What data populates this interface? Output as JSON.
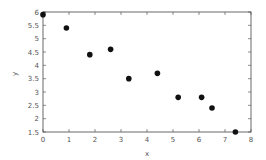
{
  "chart_data": {
    "type": "scatter",
    "title": "",
    "xlabel": "x",
    "ylabel": "y",
    "xlim": [
      0,
      8
    ],
    "ylim": [
      1.5,
      6
    ],
    "x_ticks": [
      "0",
      "1",
      "2",
      "3",
      "4",
      "5",
      "6",
      "7",
      "8"
    ],
    "y_ticks": [
      "1.5",
      "2",
      "2.5",
      "3",
      "3.5",
      "4",
      "4.5",
      "5",
      "5.5",
      "6"
    ],
    "grid": false,
    "legend": null,
    "series": [
      {
        "name": "data",
        "color": "#111111",
        "points": [
          {
            "x": 0.0,
            "y": 5.9
          },
          {
            "x": 0.9,
            "y": 5.4
          },
          {
            "x": 1.8,
            "y": 4.4
          },
          {
            "x": 2.6,
            "y": 4.6
          },
          {
            "x": 3.3,
            "y": 3.5
          },
          {
            "x": 4.4,
            "y": 3.7
          },
          {
            "x": 5.2,
            "y": 2.8
          },
          {
            "x": 6.1,
            "y": 2.8
          },
          {
            "x": 6.5,
            "y": 2.4
          },
          {
            "x": 7.4,
            "y": 1.5
          }
        ]
      }
    ]
  }
}
